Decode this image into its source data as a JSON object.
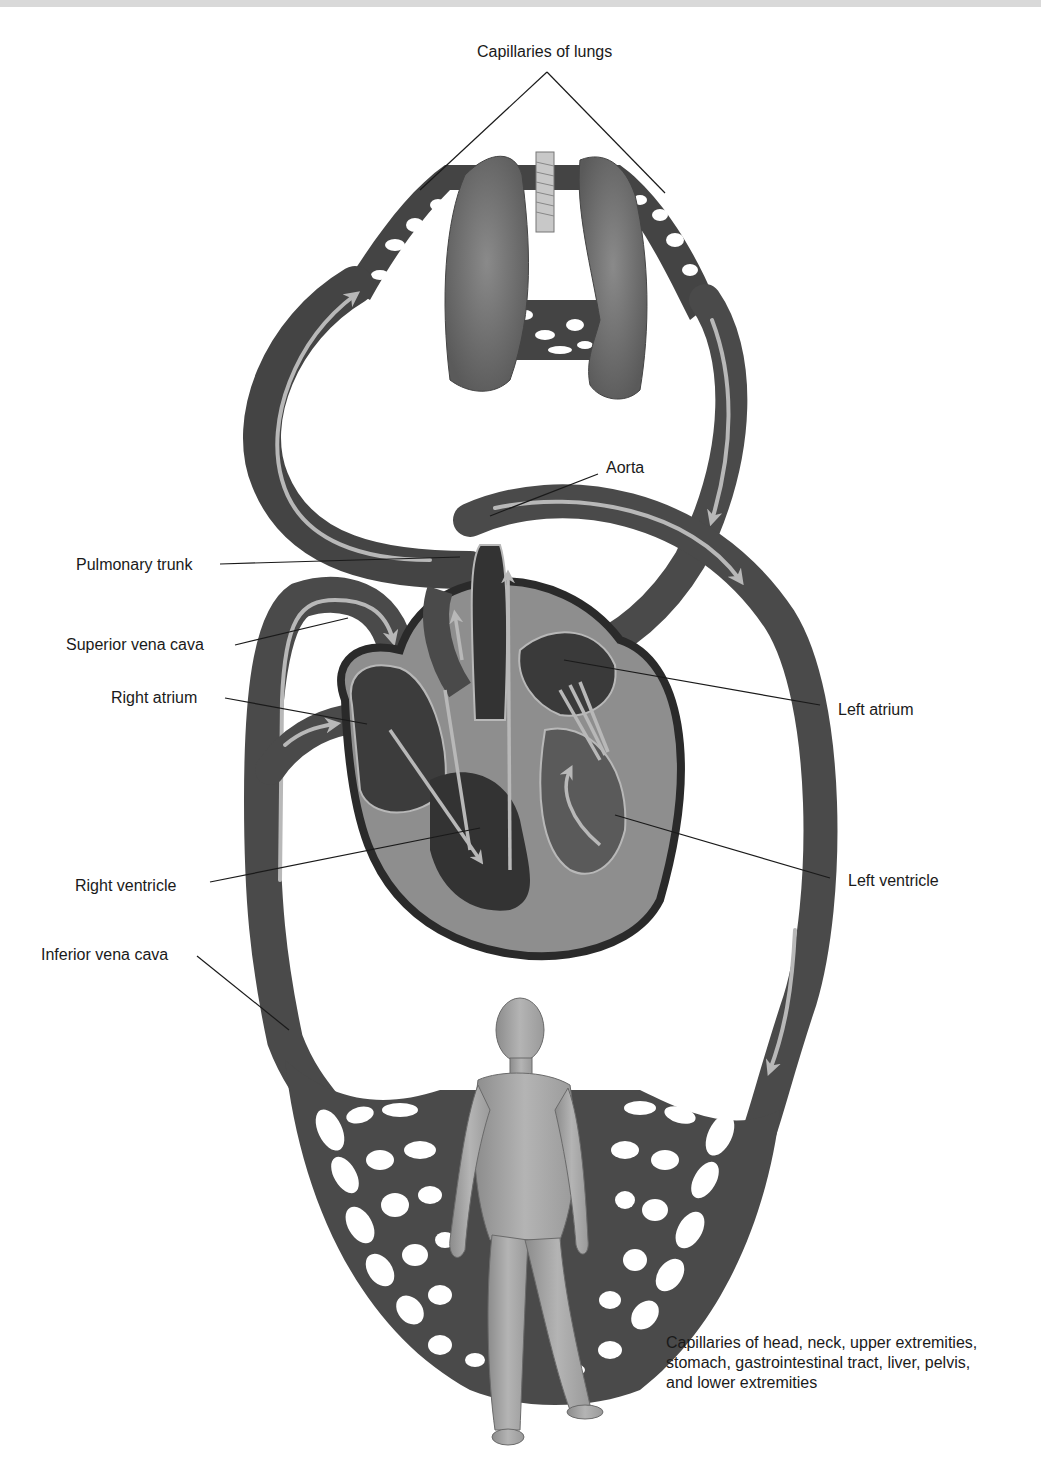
{
  "diagram": {
    "colors": {
      "vessel": "#4a4a4a",
      "vessel_dark": "#2e2e2e",
      "flow_arrow": "#b8b8b8",
      "heart_muscle": "#9a9a9a",
      "heart_chamber": "#3a3a3a",
      "lung": "#6e6e6e",
      "body_figure": "#a8a8a8",
      "leader_line": "#1a1a1a",
      "top_band": "#d9d9d9"
    },
    "labels": {
      "capillaries_lungs": "Capillaries of lungs",
      "aorta": "Aorta",
      "pulmonary_trunk": "Pulmonary trunk",
      "superior_vena_cava": "Superior vena cava",
      "right_atrium": "Right atrium",
      "left_atrium": "Left atrium",
      "right_ventricle": "Right ventricle",
      "left_ventricle": "Left ventricle",
      "inferior_vena_cava": "Inferior vena cava",
      "systemic_capillaries": {
        "line1": "Capillaries of head, neck, upper extremities,",
        "line2": "stomach, gastrointestinal tract, liver, pelvis,",
        "line3": "and lower extremities"
      }
    },
    "icons": {
      "lungs": "lungs-icon",
      "heart": "heart-icon",
      "human_figure": "human-figure-icon",
      "flow_arrows": "flow-arrow-icon"
    }
  }
}
